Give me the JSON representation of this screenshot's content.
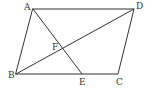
{
  "figure": {
    "type": "parallelogram-geometry",
    "stroke_color": "#333333",
    "background": "#ffffff",
    "points": {
      "A": {
        "label": "A",
        "x": 33,
        "y": 9
      },
      "B": {
        "label": "B",
        "x": 16,
        "y": 74
      },
      "C": {
        "label": "C",
        "x": 118,
        "y": 74
      },
      "D": {
        "label": "D",
        "x": 134,
        "y": 9
      },
      "E": {
        "label": "E",
        "x": 82,
        "y": 74
      },
      "F": {
        "label": "F",
        "x": 63,
        "y": 49
      }
    },
    "segments": [
      "AD",
      "DC",
      "CB",
      "BA",
      "AE",
      "BD"
    ]
  }
}
